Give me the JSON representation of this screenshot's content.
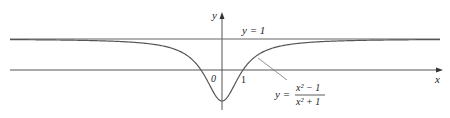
{
  "chart_data": {
    "type": "line",
    "title": "",
    "function": "y = (x^2 - 1)/(x^2 + 1)",
    "xlabel": "x",
    "ylabel": "y",
    "series": [
      {
        "name": "y = (x^2 - 1)/(x^2 + 1)",
        "x": [
          -10,
          -5,
          -3,
          -2,
          -1,
          -0.5,
          0,
          0.5,
          1,
          2,
          3,
          5,
          10
        ],
        "values": [
          0.98,
          0.923,
          0.8,
          0.6,
          0,
          -0.6,
          -1,
          -0.6,
          0,
          0.6,
          0.8,
          0.923,
          0.98
        ]
      }
    ],
    "asymptote": {
      "y": 1,
      "label": "y = 1"
    },
    "ticks": {
      "origin": "0",
      "x_one": "1"
    },
    "grid": false,
    "legend": "none"
  },
  "labels": {
    "y_axis": "y",
    "x_axis": "x",
    "origin": "0",
    "tick_one": "1",
    "asymptote": "y = 1",
    "eq_y": "y =",
    "eq_num": "x² − 1",
    "eq_den": "x² + 1"
  },
  "colors": {
    "axis": "#444444",
    "curve": "#555555",
    "asymptote": "#555555"
  }
}
